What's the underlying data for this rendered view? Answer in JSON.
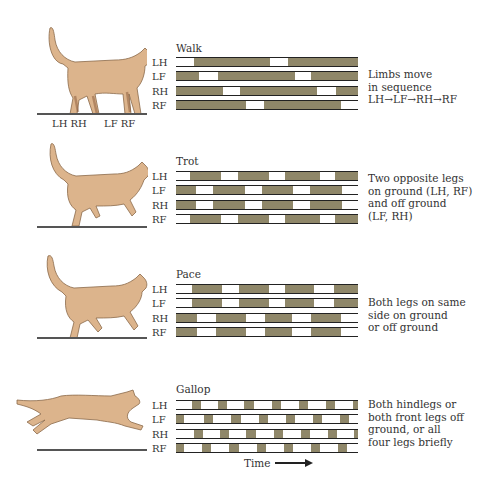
{
  "figure": {
    "bar_color": "#8f8769",
    "cat_color": "#dcb48c",
    "row_labels": [
      "LH",
      "LF",
      "RH",
      "RF"
    ],
    "time_label": "Time",
    "leg_labels": {
      "hind": "LH RH",
      "front": "LF RF"
    }
  },
  "gaits": [
    {
      "name": "Walk",
      "description": "Limbs move\nin sequence\nLH→LF→RH→RF",
      "rows": [
        {
          "leg": "LH",
          "on_ground": [
            [
              18,
              94
            ],
            [
              112,
              182
            ]
          ]
        },
        {
          "leg": "LF",
          "on_ground": [
            [
              0,
              23
            ],
            [
              42,
              119
            ],
            [
              135,
              182
            ]
          ]
        },
        {
          "leg": "RH",
          "on_ground": [
            [
              0,
              47
            ],
            [
              64,
              141
            ],
            [
              160,
              182
            ]
          ]
        },
        {
          "leg": "RF",
          "on_ground": [
            [
              0,
              70
            ],
            [
              88,
              165
            ]
          ]
        }
      ]
    },
    {
      "name": "Trot",
      "description": "Two opposite legs\non ground (LH, RF)\nand off ground\n(LF, RH)",
      "rows": [
        {
          "leg": "LH",
          "on_ground": [
            [
              14,
              45
            ],
            [
              62,
              93
            ],
            [
              109,
              144
            ],
            [
              159,
              182
            ]
          ]
        },
        {
          "leg": "LF",
          "on_ground": [
            [
              0,
              20
            ],
            [
              37,
              69
            ],
            [
              86,
              117
            ],
            [
              134,
              166
            ]
          ]
        },
        {
          "leg": "RH",
          "on_ground": [
            [
              0,
              20
            ],
            [
              37,
              69
            ],
            [
              86,
              117
            ],
            [
              134,
              166
            ]
          ]
        },
        {
          "leg": "RF",
          "on_ground": [
            [
              14,
              45
            ],
            [
              62,
              93
            ],
            [
              109,
              144
            ],
            [
              159,
              182
            ]
          ]
        }
      ]
    },
    {
      "name": "Pace",
      "description": "Both legs on same\nside on ground\nor off ground",
      "rows": [
        {
          "leg": "LH",
          "on_ground": [
            [
              16,
              46
            ],
            [
              63,
              93
            ],
            [
              109,
              138
            ],
            [
              158,
              182
            ]
          ]
        },
        {
          "leg": "LF",
          "on_ground": [
            [
              16,
              46
            ],
            [
              63,
              93
            ],
            [
              109,
              138
            ],
            [
              158,
              182
            ]
          ]
        },
        {
          "leg": "RH",
          "on_ground": [
            [
              0,
              21
            ],
            [
              40,
              70
            ],
            [
              89,
              116
            ],
            [
              135,
              165
            ]
          ]
        },
        {
          "leg": "RF",
          "on_ground": [
            [
              0,
              21
            ],
            [
              40,
              70
            ],
            [
              89,
              116
            ],
            [
              135,
              165
            ]
          ]
        }
      ]
    },
    {
      "name": "Gallop",
      "description": "Both hindlegs or\nboth front legs off\nground, or all\nfour legs briefly",
      "rows": [
        {
          "leg": "LH",
          "on_ground": [
            [
              16,
              25
            ],
            [
              42,
              51
            ],
            [
              68,
              78
            ],
            [
              96,
              105
            ],
            [
              123,
              132
            ],
            [
              150,
              159
            ],
            [
              177,
              182
            ]
          ]
        },
        {
          "leg": "LF",
          "on_ground": [
            [
              0,
              8
            ],
            [
              28,
              37
            ],
            [
              55,
              65
            ],
            [
              83,
              92
            ],
            [
              110,
              119
            ],
            [
              137,
              146
            ],
            [
              164,
              173
            ]
          ]
        },
        {
          "leg": "RH",
          "on_ground": [
            [
              18,
              27
            ],
            [
              44,
              53
            ],
            [
              70,
              80
            ],
            [
              98,
              107
            ],
            [
              125,
              134
            ],
            [
              152,
              161
            ],
            [
              178,
              182
            ]
          ]
        },
        {
          "leg": "RF",
          "on_ground": [
            [
              0,
              8
            ],
            [
              26,
              35
            ],
            [
              53,
              63
            ],
            [
              81,
              90
            ],
            [
              108,
              117
            ],
            [
              135,
              144
            ],
            [
              162,
              171
            ]
          ]
        }
      ]
    }
  ]
}
